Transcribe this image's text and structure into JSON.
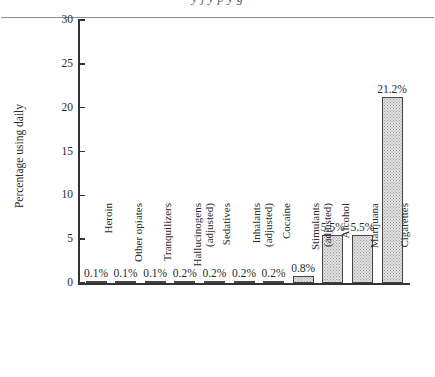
{
  "page": {
    "running_text": "y j y p y g"
  },
  "chart_data": {
    "type": "bar",
    "title": "",
    "xlabel": "",
    "ylabel": "Percentage using daily",
    "ylim": [
      0,
      30
    ],
    "ytick_labels": [
      "30",
      "25",
      "20",
      "15",
      "10",
      "5",
      "0"
    ],
    "ytick_values": [
      30,
      25,
      20,
      15,
      10,
      5,
      0
    ],
    "grid": false,
    "legend": false,
    "categories": [
      "Heroin",
      "Other opiates",
      "Tranquilizers",
      "Hallucinogens (adjusted)",
      "Sedatives",
      "Inhalants (adjusted)",
      "Cocaine",
      "Stimulants (adjusted)",
      "Alcohol",
      "Marijuana",
      "Cigarettes"
    ],
    "category_lines": [
      [
        "Heroin",
        ""
      ],
      [
        "Other opiates",
        ""
      ],
      [
        "Tranquilizers",
        ""
      ],
      [
        "Hallucinogens",
        "(adjusted)"
      ],
      [
        "Sedatives",
        ""
      ],
      [
        "Inhalants",
        "(adjusted)"
      ],
      [
        "Cocaine",
        ""
      ],
      [
        "Stimulants",
        "(adjusted)"
      ],
      [
        "Alcohol",
        ""
      ],
      [
        "Marijuana",
        ""
      ],
      [
        "Cigarettes",
        ""
      ]
    ],
    "values": [
      0.1,
      0.1,
      0.1,
      0.2,
      0.2,
      0.2,
      0.2,
      0.8,
      5.5,
      5.5,
      21.2
    ],
    "value_labels": [
      "0.1%",
      "0.1%",
      "0.1%",
      "0.2%",
      "0.2%",
      "0.2%",
      "0.2%",
      "0.8%",
      "5.5%",
      "5.5%",
      "21.2%"
    ],
    "colors": {
      "bar_fill": "#e2e2e2",
      "bar_stipple": "#9a9a9a",
      "bar_outline": "#444444",
      "axis": "#333333",
      "text": "#2a2a2a",
      "background": "#ffffff",
      "rule": "#8e8e8e"
    }
  }
}
